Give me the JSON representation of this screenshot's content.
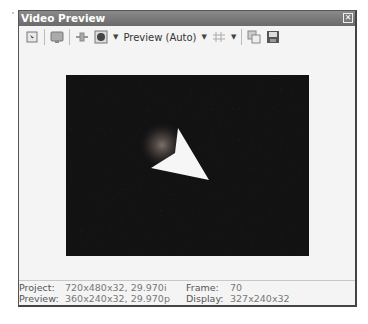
{
  "window": {
    "title": "Video Preview",
    "close_icon": "close-icon"
  },
  "toolbar": {
    "items": [
      {
        "icon": "properties-icon"
      },
      {
        "icon": "external-monitor-icon"
      },
      {
        "icon": "split-screen-icon"
      },
      {
        "icon": "preview-quality-icon"
      },
      {
        "icon": "grid-icon"
      },
      {
        "icon": "copy-snapshot-icon"
      },
      {
        "icon": "save-snapshot-icon"
      }
    ],
    "quality_label": "Preview (Auto)"
  },
  "status": {
    "project_label": "Project:",
    "project_value": "720x480x32, 29.970i",
    "preview_label": "Preview:",
    "preview_value": "360x240x32, 29.970p",
    "frame_label": "Frame:",
    "frame_value": "70",
    "display_label": "Display:",
    "display_value": "327x240x32"
  }
}
